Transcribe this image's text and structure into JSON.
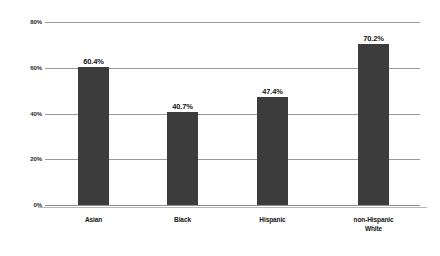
{
  "chart_data": {
    "type": "bar",
    "title": "",
    "subtitle": "",
    "xlabel": "",
    "ylabel": "",
    "categories": [
      "Asian",
      "Black",
      "Hispanic",
      "non-Hispanic White"
    ],
    "category_lines": [
      [
        "Asian"
      ],
      [
        "Black"
      ],
      [
        "Hispanic"
      ],
      [
        "non-Hispanic",
        "White"
      ]
    ],
    "values": [
      60.4,
      40.7,
      47.4,
      70.2
    ],
    "value_labels": [
      "60.4%",
      "40.7%",
      "47.4%",
      "70.2%"
    ],
    "ylim": [
      0,
      80
    ],
    "yticks": [
      0,
      20,
      40,
      60,
      80
    ],
    "ytick_labels": [
      "0%",
      "20%",
      "40%",
      "60%",
      "80%"
    ],
    "grid": true,
    "grid_axis": "y",
    "legend": false,
    "legend_position": "none",
    "colors": {
      "bar": "#3c3c3c",
      "gridline": "#9a9a9a",
      "baseline": "#b8b8b8",
      "text": "#141414",
      "tick_text": "#2b2b2b",
      "background": "#ffffff"
    }
  }
}
